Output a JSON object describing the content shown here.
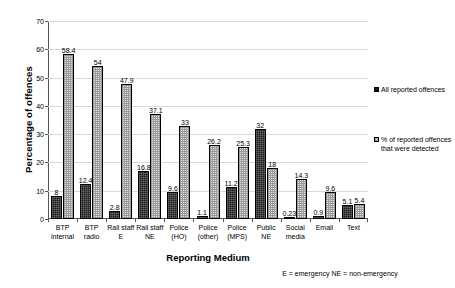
{
  "chart_data": {
    "type": "bar",
    "title": "",
    "xlabel": "Reporting Medium",
    "ylabel": "Percentage of offences",
    "ylim": [
      0,
      70
    ],
    "ytick_step": 10,
    "yticks": [
      0,
      10,
      20,
      30,
      40,
      50,
      60,
      70
    ],
    "grid": true,
    "legend_position": "right",
    "categories": [
      "BTP internal",
      "BTP radio",
      "Rail staff E",
      "Rail staff NE",
      "Police (HO)",
      "Police (other)",
      "Police (MPS)",
      "Public NE",
      "Social media",
      "Email",
      "Text"
    ],
    "category_lines": [
      [
        "BTP",
        "internal"
      ],
      [
        "BTP radio"
      ],
      [
        "Rail staff",
        "E"
      ],
      [
        "Rail staff",
        "NE"
      ],
      [
        "Police",
        "(HO)"
      ],
      [
        "Police",
        "(other)"
      ],
      [
        "Police",
        "(MPS)"
      ],
      [
        "Public NE"
      ],
      [
        "Social",
        "media"
      ],
      [
        "Email"
      ],
      [
        "Text"
      ]
    ],
    "series": [
      {
        "name": "All reported offences",
        "color": "#1a1a1a",
        "values": [
          8,
          12.4,
          2.8,
          16.8,
          9.6,
          1.1,
          11.2,
          32,
          0.23,
          0.9,
          5.1
        ],
        "labels": [
          "8",
          "12.4",
          "2.8",
          "16.8",
          "9.6",
          "1.1",
          "11.2",
          "32",
          "0.23",
          "0.9",
          "5.1"
        ]
      },
      {
        "name": "% of reported offences that were detected",
        "color": "#e2e2e2",
        "values": [
          58.4,
          54,
          47.9,
          37.1,
          33,
          26.2,
          25.3,
          18,
          14.3,
          9.6,
          5.4
        ],
        "labels": [
          "58.4",
          "54",
          "47.9",
          "37.1",
          "33",
          "26.2",
          "25.3",
          "18",
          "14.3",
          "9.6",
          "5.4"
        ]
      }
    ],
    "annotations": [
      "E = emergency  NE = non-emergency"
    ]
  },
  "legend": {
    "entries": [
      {
        "label": "All reported offences",
        "swatch": "dark"
      },
      {
        "label": "% of reported offences that were detected",
        "swatch": "light"
      }
    ]
  },
  "footnote": "E = emergency  NE = non-emergency"
}
